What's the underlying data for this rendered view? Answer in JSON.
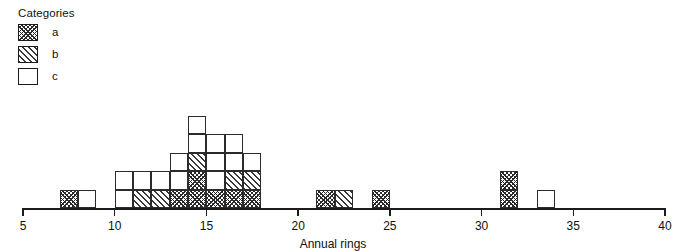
{
  "legend": {
    "title": "Categories",
    "items": [
      {
        "label": "a",
        "key": "a",
        "pattern": "cross-hatch",
        "color": "#2a2a2a"
      },
      {
        "label": "b",
        "key": "b",
        "pattern": "diagonal-hatch",
        "color": "#3a3a3a"
      },
      {
        "label": "c",
        "key": "c",
        "pattern": "empty",
        "color": "#ffffff"
      }
    ]
  },
  "chart_data": {
    "type": "bar",
    "subtype": "stacked-histogram",
    "title": "",
    "xlabel": "Annual rings",
    "ylabel": "",
    "xlim": [
      5,
      40
    ],
    "ylim": [
      0,
      5
    ],
    "grid": false,
    "bin_width": 1,
    "unit_height": 1,
    "legend_position": "top-left",
    "xticks": [
      5,
      10,
      15,
      20,
      25,
      30,
      35,
      40
    ],
    "xtick_labels": [
      "5",
      "10",
      "15",
      "20",
      "25",
      "30",
      "35",
      "40"
    ],
    "categories": [
      "a",
      "b",
      "c"
    ],
    "bins": [
      {
        "x0": 7,
        "x1": 8,
        "stack": [
          "a"
        ]
      },
      {
        "x0": 8,
        "x1": 9,
        "stack": [
          "c"
        ]
      },
      {
        "x0": 10,
        "x1": 11,
        "stack": [
          "c",
          "c"
        ]
      },
      {
        "x0": 11,
        "x1": 12,
        "stack": [
          "b",
          "c"
        ]
      },
      {
        "x0": 12,
        "x1": 13,
        "stack": [
          "b",
          "c"
        ]
      },
      {
        "x0": 13,
        "x1": 14,
        "stack": [
          "a",
          "c",
          "c"
        ]
      },
      {
        "x0": 14,
        "x1": 15,
        "stack": [
          "a",
          "a",
          "b",
          "c",
          "c"
        ]
      },
      {
        "x0": 15,
        "x1": 16,
        "stack": [
          "a",
          "c",
          "c",
          "c"
        ]
      },
      {
        "x0": 16,
        "x1": 17,
        "stack": [
          "a",
          "b",
          "c",
          "c"
        ]
      },
      {
        "x0": 17,
        "x1": 18,
        "stack": [
          "a",
          "b",
          "c"
        ]
      },
      {
        "x0": 21,
        "x1": 22,
        "stack": [
          "a"
        ]
      },
      {
        "x0": 22,
        "x1": 23,
        "stack": [
          "b"
        ]
      },
      {
        "x0": 24,
        "x1": 25,
        "stack": [
          "a"
        ]
      },
      {
        "x0": 31,
        "x1": 32,
        "stack": [
          "a",
          "a"
        ]
      },
      {
        "x0": 33,
        "x1": 34,
        "stack": [
          "c"
        ]
      }
    ],
    "series": [
      {
        "name": "a",
        "x": [
          7,
          13,
          14,
          15,
          16,
          17,
          21,
          24,
          31
        ],
        "values": [
          1,
          1,
          2,
          1,
          1,
          1,
          1,
          1,
          2
        ]
      },
      {
        "name": "b",
        "x": [
          11,
          12,
          14,
          16,
          17,
          22
        ],
        "values": [
          1,
          1,
          1,
          1,
          1,
          1
        ]
      },
      {
        "name": "c",
        "x": [
          8,
          10,
          11,
          12,
          13,
          14,
          15,
          16,
          17,
          33
        ],
        "values": [
          1,
          2,
          1,
          1,
          2,
          2,
          3,
          2,
          1,
          1
        ]
      }
    ]
  },
  "geometry": {
    "axis_left_px": 23,
    "axis_right_px": 665,
    "baseline_y_px": 208,
    "cell_height_px": 18.5
  }
}
